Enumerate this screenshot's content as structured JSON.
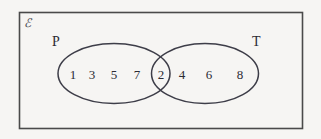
{
  "diagram": {
    "type": "venn",
    "title": "",
    "universe": {
      "label": "ℰ",
      "name": "universal-set"
    },
    "sets": [
      {
        "id": "P",
        "label": "P",
        "side": "left"
      },
      {
        "id": "T",
        "label": "T",
        "side": "right"
      }
    ],
    "regions": {
      "left_only": {
        "set": "P",
        "elements": [
          "1",
          "3",
          "5",
          "7"
        ]
      },
      "intersection": {
        "sets": [
          "P",
          "T"
        ],
        "elements": [
          "2"
        ]
      },
      "right_only": {
        "set": "T",
        "elements": [
          "4",
          "6",
          "8"
        ]
      },
      "outside": {
        "elements": []
      }
    },
    "elements_in_order": [
      "1",
      "3",
      "5",
      "7",
      "2",
      "4",
      "6",
      "8"
    ],
    "colors": {
      "background": "#f6f5f3",
      "rect_stroke": "#4a4a4a",
      "ellipse_stroke": "#3d3d48",
      "text": "#2b2b33"
    }
  }
}
